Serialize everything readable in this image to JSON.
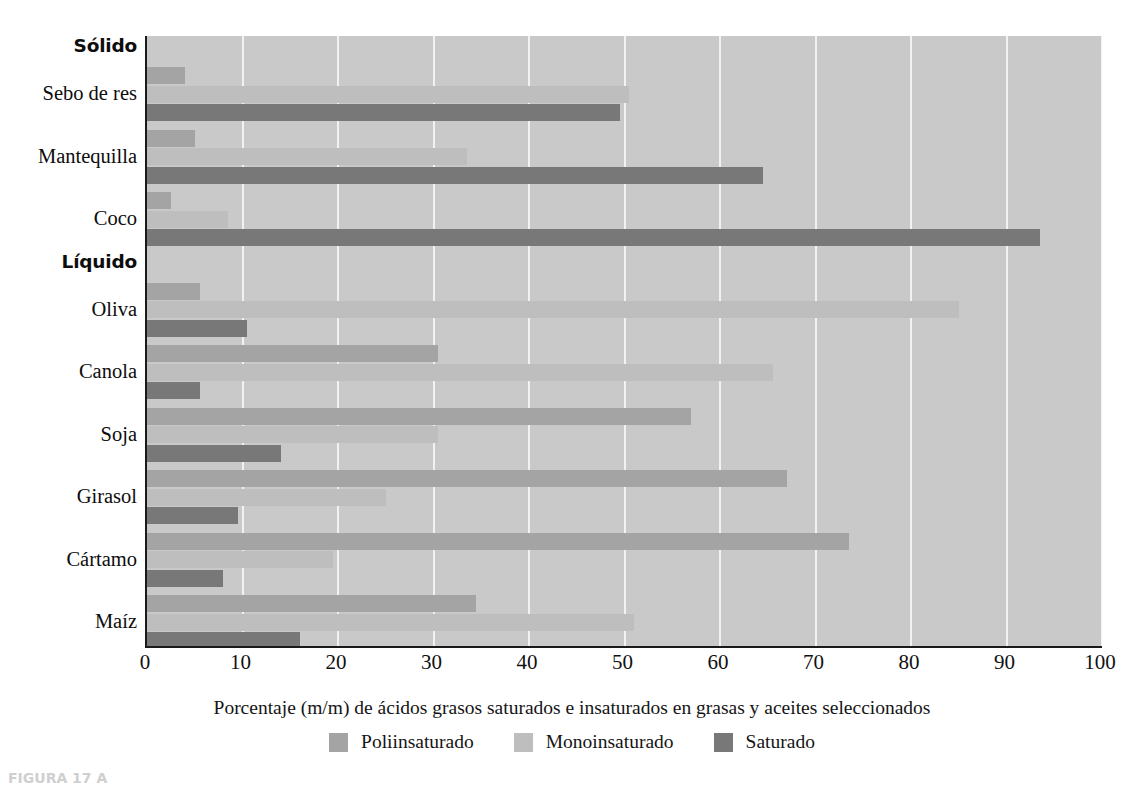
{
  "chart_data": {
    "type": "bar",
    "orientation": "horizontal",
    "title": "",
    "xlabel": "Porcentaje (m/m) de ácidos grasos saturados e insaturados en grasas y aceites seleccionados",
    "ylabel": "",
    "xlim": [
      0,
      100
    ],
    "xticks": [
      0,
      10,
      20,
      30,
      40,
      50,
      60,
      70,
      80,
      90,
      100
    ],
    "xtick_labels": [
      "0",
      "10",
      "20",
      "30",
      "40",
      "50",
      "60",
      "70",
      "80",
      "90",
      "100"
    ],
    "grid": true,
    "grid_axis": "x",
    "legend_position": "bottom",
    "categories": [
      "Sebo de res",
      "Mantequilla",
      "Coco",
      "Oliva",
      "Canola",
      "Soja",
      "Girasol",
      "Cártamo",
      "Maíz"
    ],
    "groups": [
      {
        "label": "Sólido",
        "categories": [
          "Sebo de res",
          "Mantequilla",
          "Coco"
        ]
      },
      {
        "label": "Líquido",
        "categories": [
          "Oliva",
          "Canola",
          "Soja",
          "Girasol",
          "Cártamo",
          "Maíz"
        ]
      }
    ],
    "series": [
      {
        "name": "Poliinsaturado",
        "color": "#a4a4a4",
        "values": [
          4,
          5,
          2.5,
          5.5,
          30.5,
          57,
          67,
          73.5,
          34.5
        ]
      },
      {
        "name": "Monoinsaturado",
        "color": "#bebebe",
        "values": [
          50.5,
          33.5,
          8.5,
          85,
          65.5,
          30.5,
          25,
          19.5,
          51
        ]
      },
      {
        "name": "Saturado",
        "color": "#787878",
        "values": [
          49.5,
          64.5,
          93.5,
          10.5,
          5.5,
          14,
          9.5,
          8,
          16
        ]
      }
    ]
  },
  "axis": {
    "plot_background": "#c9c9c9",
    "gridline_color": "#f2f2f2",
    "axis_line_color": "#1a1a1a"
  },
  "rows": [
    {
      "label": "Sólido",
      "kind": "section"
    },
    {
      "label": "Sebo de res",
      "kind": "category",
      "index": 0
    },
    {
      "label": "Mantequilla",
      "kind": "category",
      "index": 1
    },
    {
      "label": "Coco",
      "kind": "category",
      "index": 2
    },
    {
      "label": "Líquido",
      "kind": "section"
    },
    {
      "label": "Oliva",
      "kind": "category",
      "index": 3
    },
    {
      "label": "Canola",
      "kind": "category",
      "index": 4
    },
    {
      "label": "Soja",
      "kind": "category",
      "index": 5
    },
    {
      "label": "Girasol",
      "kind": "category",
      "index": 6
    },
    {
      "label": "Cártamo",
      "kind": "category",
      "index": 7
    },
    {
      "label": "Maíz",
      "kind": "category",
      "index": 8
    }
  ],
  "legend": [
    {
      "label": "Poliinsaturado",
      "key": "poly",
      "color": "#a4a4a4"
    },
    {
      "label": "Monoinsaturado",
      "key": "mono",
      "color": "#bebebe"
    },
    {
      "label": "Saturado",
      "key": "sat",
      "color": "#787878"
    }
  ],
  "caption": {
    "text": "FIGURA 17 A"
  }
}
